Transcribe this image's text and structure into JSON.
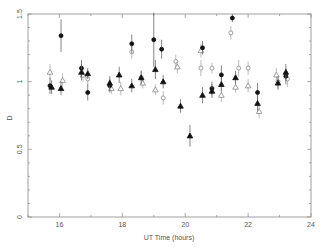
{
  "chart_data": {
    "type": "scatter",
    "title": "",
    "xlabel": "UT Time (hours)",
    "ylabel": "D",
    "xlim": [
      15,
      24
    ],
    "ylim": [
      0,
      1.5
    ],
    "x_ticks": [
      16,
      18,
      20,
      22,
      24
    ],
    "y_ticks": [
      0,
      0.5,
      1,
      1.5
    ],
    "x_tick_labels": [
      "16",
      "18",
      "20",
      "22",
      "24"
    ],
    "y_tick_labels": [
      "0",
      "0.5",
      "1",
      "1.5"
    ],
    "grid": false,
    "legend": [],
    "series": [
      {
        "name": "filled-circle",
        "marker": "circle-filled",
        "points": [
          {
            "x": 15.7,
            "y": 0.97,
            "err": 0.06
          },
          {
            "x": 16.05,
            "y": 1.34,
            "err": 0.12
          },
          {
            "x": 16.7,
            "y": 1.1,
            "err": 0.06
          },
          {
            "x": 16.9,
            "y": 0.92,
            "err": 0.06
          },
          {
            "x": 17.6,
            "y": 0.97,
            "err": 0.05
          },
          {
            "x": 18.3,
            "y": 1.28,
            "err": 0.07
          },
          {
            "x": 19.0,
            "y": 1.31,
            "err": 0.2
          },
          {
            "x": 19.25,
            "y": 1.24,
            "err": 0.07
          },
          {
            "x": 20.55,
            "y": 1.25,
            "err": 0.05
          },
          {
            "x": 20.85,
            "y": 0.95,
            "err": 0.05
          },
          {
            "x": 21.15,
            "y": 1.05,
            "err": 0.07
          },
          {
            "x": 21.5,
            "y": 1.47,
            "err": 0.03
          },
          {
            "x": 22.3,
            "y": 0.92,
            "err": 0.07
          },
          {
            "x": 23.2,
            "y": 1.04,
            "err": 0.06
          }
        ]
      },
      {
        "name": "filled-triangle",
        "marker": "triangle-filled",
        "points": [
          {
            "x": 15.75,
            "y": 0.96,
            "err": 0.05
          },
          {
            "x": 16.05,
            "y": 0.95,
            "err": 0.05
          },
          {
            "x": 16.7,
            "y": 1.07,
            "err": 0.06
          },
          {
            "x": 16.9,
            "y": 1.06,
            "err": 0.04
          },
          {
            "x": 17.6,
            "y": 0.99,
            "err": 0.05
          },
          {
            "x": 17.9,
            "y": 1.05,
            "err": 0.06
          },
          {
            "x": 18.3,
            "y": 0.97,
            "err": 0.05
          },
          {
            "x": 18.6,
            "y": 1.03,
            "err": 0.05
          },
          {
            "x": 19.05,
            "y": 1.09,
            "err": 0.07
          },
          {
            "x": 19.3,
            "y": 1.0,
            "err": 0.05
          },
          {
            "x": 19.85,
            "y": 0.82,
            "err": 0.05
          },
          {
            "x": 20.15,
            "y": 0.6,
            "err": 0.08
          },
          {
            "x": 20.55,
            "y": 0.9,
            "err": 0.06
          },
          {
            "x": 20.85,
            "y": 0.93,
            "err": 0.05
          },
          {
            "x": 21.15,
            "y": 0.98,
            "err": 0.05
          },
          {
            "x": 21.6,
            "y": 1.03,
            "err": 0.05
          },
          {
            "x": 22.3,
            "y": 0.84,
            "err": 0.06
          },
          {
            "x": 22.95,
            "y": 0.99,
            "err": 0.05
          },
          {
            "x": 23.2,
            "y": 1.07,
            "err": 0.06
          }
        ]
      },
      {
        "name": "open-circle",
        "marker": "circle-open",
        "points": [
          {
            "x": 16.9,
            "y": 1.02,
            "err": 0.05
          },
          {
            "x": 18.3,
            "y": 1.22,
            "err": 0.05
          },
          {
            "x": 18.6,
            "y": 1.03,
            "err": 0.05
          },
          {
            "x": 19.3,
            "y": 0.88,
            "err": 0.05
          },
          {
            "x": 19.7,
            "y": 1.15,
            "err": 0.05
          },
          {
            "x": 20.5,
            "y": 1.1,
            "err": 0.06
          },
          {
            "x": 20.85,
            "y": 1.1,
            "err": 0.04
          },
          {
            "x": 21.45,
            "y": 1.36,
            "err": 0.05
          },
          {
            "x": 21.7,
            "y": 1.1,
            "err": 0.06
          },
          {
            "x": 22.0,
            "y": 1.1,
            "err": 0.05
          },
          {
            "x": 22.95,
            "y": 1.0,
            "err": 0.05
          },
          {
            "x": 23.25,
            "y": 1.02,
            "err": 0.06
          }
        ]
      },
      {
        "name": "open-triangle",
        "marker": "triangle-open",
        "points": [
          {
            "x": 15.7,
            "y": 1.07,
            "err": 0.06
          },
          {
            "x": 16.1,
            "y": 1.01,
            "err": 0.05
          },
          {
            "x": 16.75,
            "y": 1.05,
            "err": 0.05
          },
          {
            "x": 17.65,
            "y": 0.95,
            "err": 0.04
          },
          {
            "x": 17.95,
            "y": 0.95,
            "err": 0.05
          },
          {
            "x": 18.65,
            "y": 0.99,
            "err": 0.04
          },
          {
            "x": 19.05,
            "y": 0.94,
            "err": 0.04
          },
          {
            "x": 19.75,
            "y": 1.11,
            "err": 0.05
          },
          {
            "x": 20.5,
            "y": 1.23,
            "err": 0.05
          },
          {
            "x": 21.15,
            "y": 0.9,
            "err": 0.05
          },
          {
            "x": 21.6,
            "y": 0.96,
            "err": 0.04
          },
          {
            "x": 22.0,
            "y": 0.97,
            "err": 0.05
          },
          {
            "x": 22.35,
            "y": 0.78,
            "err": 0.05
          },
          {
            "x": 22.9,
            "y": 1.05,
            "err": 0.05
          }
        ]
      }
    ]
  }
}
